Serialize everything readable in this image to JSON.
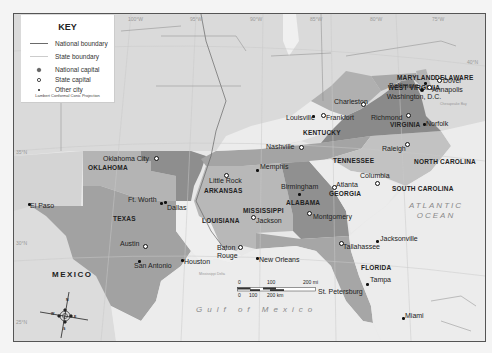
{
  "key": {
    "title": "KEY",
    "items": [
      {
        "symbol": "national-boundary-line",
        "label": "National boundary"
      },
      {
        "symbol": "state-boundary-line",
        "label": "State boundary"
      },
      {
        "symbol": "national-capital-dot",
        "label": "National capital"
      },
      {
        "symbol": "state-capital-circle",
        "label": "State capital"
      },
      {
        "symbol": "other-city-dot",
        "label": "Other city"
      }
    ],
    "projection": "Lambert Conformal Conic Projection"
  },
  "longitude_ticks": [
    "100°W",
    "95°W",
    "90°W",
    "85°W",
    "80°W",
    "75°W"
  ],
  "latitude_ticks": [
    "35°N",
    "30°N",
    "25°N",
    "40°N"
  ],
  "states": {
    "west_virginia": "WEST VIRGINIA",
    "maryland": "MARYLAND",
    "delaware": "DELAWARE",
    "virginia": "VIRGINIA",
    "kentucky": "KENTUCKY",
    "tennessee": "TENNESSEE",
    "north_carolina": "NORTH CAROLINA",
    "south_carolina": "SOUTH CAROLINA",
    "oklahoma": "OKLAHOMA",
    "arkansas": "ARKANSAS",
    "texas": "TEXAS",
    "louisiana": "LOUISIANA",
    "mississippi": "MISSISSIPPI",
    "alabama": "ALABAMA",
    "georgia": "GEORGIA",
    "florida": "FLORIDA"
  },
  "countries": {
    "mexico": "MEXICO"
  },
  "water": {
    "atlantic": "ATLANTIC OCEAN",
    "gulf": "Gulf of Mexico",
    "mississippi_delta": "Mississippi Delta",
    "chesapeake": "Chesapeake Bay"
  },
  "cities": {
    "washington": {
      "name": "Washington, D.C.",
      "type": "national-capital"
    },
    "baltimore": {
      "name": "Baltimore",
      "type": "other-city"
    },
    "dover": {
      "name": "Dover",
      "type": "state-capital"
    },
    "annapolis": {
      "name": "Annapolis",
      "type": "state-capital"
    },
    "charleston": {
      "name": "Charleston",
      "type": "state-capital"
    },
    "richmond": {
      "name": "Richmond",
      "type": "state-capital"
    },
    "norfolk": {
      "name": "Norfolk",
      "type": "other-city"
    },
    "louisville": {
      "name": "Louisville",
      "type": "other-city"
    },
    "frankfort": {
      "name": "Frankfort",
      "type": "state-capital"
    },
    "nashville": {
      "name": "Nashville",
      "type": "state-capital"
    },
    "memphis": {
      "name": "Memphis",
      "type": "other-city"
    },
    "raleigh": {
      "name": "Raleigh",
      "type": "state-capital"
    },
    "columbia": {
      "name": "Columbia",
      "type": "state-capital"
    },
    "atlanta": {
      "name": "Atlanta",
      "type": "state-capital"
    },
    "birmingham": {
      "name": "Birmingham",
      "type": "other-city"
    },
    "montgomery": {
      "name": "Montgomery",
      "type": "state-capital"
    },
    "jackson": {
      "name": "Jackson",
      "type": "state-capital"
    },
    "little_rock": {
      "name": "Little Rock",
      "type": "state-capital"
    },
    "oklahoma_city": {
      "name": "Oklahoma City",
      "type": "state-capital"
    },
    "ft_worth": {
      "name": "Ft. Worth",
      "type": "other-city"
    },
    "dallas": {
      "name": "Dallas",
      "type": "other-city"
    },
    "el_paso": {
      "name": "El Paso",
      "type": "other-city"
    },
    "austin": {
      "name": "Austin",
      "type": "state-capital"
    },
    "san_antonio": {
      "name": "San Antonio",
      "type": "other-city"
    },
    "houston": {
      "name": "Houston",
      "type": "other-city"
    },
    "baton_rouge": {
      "name": "Baton Rouge",
      "type": "state-capital"
    },
    "new_orleans": {
      "name": "New Orleans",
      "type": "other-city"
    },
    "tallahassee": {
      "name": "Tallahassee",
      "type": "state-capital"
    },
    "jacksonville": {
      "name": "Jacksonville",
      "type": "other-city"
    },
    "tampa": {
      "name": "Tampa",
      "type": "other-city"
    },
    "st_petersburg": {
      "name": "St. Petersburg",
      "type": "other-city"
    },
    "miami": {
      "name": "Miami",
      "type": "other-city"
    }
  },
  "scale_bar": {
    "miles_labels": [
      "0",
      "100",
      "200 mi"
    ],
    "km_labels": [
      "0",
      "100",
      "200 km"
    ]
  },
  "compass": {
    "n": "N",
    "s": "S",
    "e": "E",
    "w": "W"
  },
  "colors": {
    "background": "#e6e6e6",
    "dark_fill": "#8e8e8e",
    "medium_fill": "#a8a8a8",
    "light_fill": "#c4c4c4",
    "pale_fill": "#ececec",
    "water": "#eeeeee"
  }
}
